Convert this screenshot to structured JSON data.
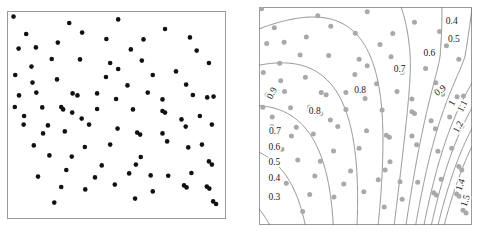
{
  "figure": {
    "type": "two-panel-scientific-figure",
    "panels": [
      "point-pattern-scatter",
      "contour-plot-with-points"
    ],
    "ghost_text": "",
    "colors": {
      "point_black": "#111111",
      "point_gray": "#a9a9a9",
      "contour_line": "#6f6f6f",
      "frame": "#9a9a9a",
      "background": "#ffffff",
      "label_text": "#1a1a1a"
    }
  },
  "chart_data": [
    {
      "type": "scatter",
      "name": "left-panel-point-pattern",
      "title": "",
      "xlabel": "",
      "ylabel": "",
      "xlim": [
        0,
        1
      ],
      "ylim": [
        0,
        1
      ],
      "grid": false,
      "legend": "none",
      "marker": {
        "shape": "circle",
        "color": "#111111",
        "size": 4.6
      },
      "n_points": 96,
      "points": [
        [
          0.012,
          0.992
        ],
        [
          0.508,
          0.978
        ],
        [
          0.73,
          0.93
        ],
        [
          0.337,
          0.912
        ],
        [
          0.848,
          0.888
        ],
        [
          0.628,
          0.878
        ],
        [
          0.222,
          0.862
        ],
        [
          0.118,
          0.838
        ],
        [
          0.036,
          0.832
        ],
        [
          0.88,
          0.822
        ],
        [
          0.193,
          0.78
        ],
        [
          0.327,
          0.778
        ],
        [
          0.62,
          0.772
        ],
        [
          0.47,
          0.76
        ],
        [
          0.938,
          0.76
        ],
        [
          0.097,
          0.742
        ],
        [
          0.508,
          0.73
        ],
        [
          0.02,
          0.7
        ],
        [
          0.218,
          0.678
        ],
        [
          0.552,
          0.648
        ],
        [
          0.83,
          0.652
        ],
        [
          0.12,
          0.612
        ],
        [
          0.292,
          0.608
        ],
        [
          0.408,
          0.608
        ],
        [
          0.038,
          0.598
        ],
        [
          0.315,
          0.598
        ],
        [
          0.96,
          0.592
        ],
        [
          0.93,
          0.588
        ],
        [
          0.718,
          0.578
        ],
        [
          0.148,
          0.538
        ],
        [
          0.238,
          0.54
        ],
        [
          0.247,
          0.528
        ],
        [
          0.408,
          0.53
        ],
        [
          0.578,
          0.528
        ],
        [
          0.718,
          0.52
        ],
        [
          0.29,
          0.512
        ],
        [
          0.73,
          0.512
        ],
        [
          0.335,
          0.482
        ],
        [
          0.06,
          0.452
        ],
        [
          0.175,
          0.448
        ],
        [
          0.952,
          0.452
        ],
        [
          0.828,
          0.442
        ],
        [
          0.505,
          0.432
        ],
        [
          0.255,
          0.418
        ],
        [
          0.598,
          0.412
        ],
        [
          0.612,
          0.402
        ],
        [
          0.718,
          0.408
        ],
        [
          0.152,
          0.408
        ],
        [
          0.74,
          0.368
        ],
        [
          0.35,
          0.34
        ],
        [
          0.84,
          0.338
        ],
        [
          0.182,
          0.298
        ],
        [
          0.288,
          0.292
        ],
        [
          0.615,
          0.29
        ],
        [
          0.592,
          0.252
        ],
        [
          0.43,
          0.248
        ],
        [
          0.938,
          0.268
        ],
        [
          0.952,
          0.252
        ],
        [
          0.128,
          0.192
        ],
        [
          0.56,
          0.208
        ],
        [
          0.662,
          0.198
        ],
        [
          0.398,
          0.188
        ],
        [
          0.745,
          0.196
        ],
        [
          0.855,
          0.21
        ],
        [
          0.492,
          0.152
        ],
        [
          0.238,
          0.14
        ],
        [
          0.82,
          0.148
        ],
        [
          0.832,
          0.138
        ],
        [
          0.928,
          0.142
        ],
        [
          0.94,
          0.132
        ],
        [
          0.672,
          0.118
        ],
        [
          0.205,
          0.062
        ],
        [
          0.062,
          0.495
        ],
        [
          0.895,
          0.495
        ],
        [
          0.672,
          0.7
        ],
        [
          0.45,
          0.69
        ],
        [
          0.782,
          0.718
        ],
        [
          0.37,
          0.452
        ],
        [
          0.108,
          0.348
        ],
        [
          0.47,
          0.352
        ],
        [
          0.905,
          0.352
        ],
        [
          0.262,
          0.225
        ],
        [
          0.352,
          0.128
        ],
        [
          0.588,
          0.082
        ],
        [
          0.958,
          0.068
        ],
        [
          0.972,
          0.055
        ],
        [
          0.102,
          0.662
        ],
        [
          0.862,
          0.6
        ],
        [
          0.452,
          0.88
        ],
        [
          0.568,
          0.828
        ],
        [
          0.276,
          0.96
        ],
        [
          0.072,
          0.905
        ],
        [
          0.648,
          0.612
        ],
        [
          0.498,
          0.58
        ],
        [
          0.808,
          0.478
        ],
        [
          0.018,
          0.54
        ]
      ]
    },
    {
      "type": "contour",
      "name": "right-panel-intensity-contours",
      "title": "",
      "xlabel": "",
      "ylabel": "",
      "xlim": [
        0,
        1
      ],
      "ylim": [
        0,
        1
      ],
      "grid": false,
      "legend": "none",
      "overlay_marker": {
        "shape": "circle",
        "color": "#a9a9a9",
        "size": 5.0
      },
      "contour_levels": [
        0.3,
        0.4,
        0.5,
        0.6,
        0.7,
        0.8,
        0.9,
        1.0,
        1.1,
        1.2,
        1.3,
        1.4,
        1.5
      ],
      "surface_description": "saddle-shaped intensity surface; low values at lower-left (0.3) rising to the right and a high ridge (1.5) at the lower-right corner",
      "labels": [
        {
          "text": "0.4",
          "x": 0.905,
          "y": 0.935,
          "rotation": 0
        },
        {
          "text": "0.5",
          "x": 0.915,
          "y": 0.855,
          "rotation": 0
        },
        {
          "text": "0.6",
          "x": 0.8,
          "y": 0.79,
          "rotation": 0
        },
        {
          "text": "0.7",
          "x": 0.66,
          "y": 0.715,
          "rotation": 0
        },
        {
          "text": "0.8",
          "x": 0.475,
          "y": 0.618,
          "rotation": 0
        },
        {
          "text": "0.9",
          "x": 0.85,
          "y": 0.618,
          "rotation": -38
        },
        {
          "text": "1",
          "x": 0.905,
          "y": 0.56,
          "rotation": -60
        },
        {
          "text": "1.1",
          "x": 0.955,
          "y": 0.545,
          "rotation": -62
        },
        {
          "text": "1.2",
          "x": 0.935,
          "y": 0.45,
          "rotation": -62
        },
        {
          "text": "0.9",
          "x": 0.06,
          "y": 0.605,
          "rotation": -62
        },
        {
          "text": "0.8",
          "x": 0.262,
          "y": 0.525,
          "rotation": 0
        },
        {
          "text": "0.7",
          "x": 0.075,
          "y": 0.432,
          "rotation": 0
        },
        {
          "text": "0.6",
          "x": 0.072,
          "y": 0.36,
          "rotation": 0
        },
        {
          "text": "0.5",
          "x": 0.072,
          "y": 0.288,
          "rotation": 0
        },
        {
          "text": "0.4",
          "x": 0.072,
          "y": 0.215,
          "rotation": 0
        },
        {
          "text": "0.3",
          "x": 0.072,
          "y": 0.128,
          "rotation": 0
        },
        {
          "text": "1.4",
          "x": 0.945,
          "y": 0.185,
          "rotation": -72
        },
        {
          "text": "1.5",
          "x": 0.968,
          "y": 0.112,
          "rotation": -72
        }
      ],
      "points": [
        [
          0.012,
          0.992
        ],
        [
          0.508,
          0.978
        ],
        [
          0.73,
          0.93
        ],
        [
          0.337,
          0.912
        ],
        [
          0.848,
          0.888
        ],
        [
          0.628,
          0.878
        ],
        [
          0.222,
          0.862
        ],
        [
          0.118,
          0.838
        ],
        [
          0.036,
          0.832
        ],
        [
          0.88,
          0.822
        ],
        [
          0.193,
          0.78
        ],
        [
          0.327,
          0.778
        ],
        [
          0.62,
          0.772
        ],
        [
          0.47,
          0.76
        ],
        [
          0.938,
          0.76
        ],
        [
          0.097,
          0.742
        ],
        [
          0.508,
          0.73
        ],
        [
          0.02,
          0.7
        ],
        [
          0.218,
          0.678
        ],
        [
          0.552,
          0.648
        ],
        [
          0.83,
          0.652
        ],
        [
          0.12,
          0.612
        ],
        [
          0.292,
          0.608
        ],
        [
          0.408,
          0.608
        ],
        [
          0.038,
          0.598
        ],
        [
          0.315,
          0.598
        ],
        [
          0.96,
          0.592
        ],
        [
          0.93,
          0.588
        ],
        [
          0.718,
          0.578
        ],
        [
          0.148,
          0.538
        ],
        [
          0.238,
          0.54
        ],
        [
          0.247,
          0.528
        ],
        [
          0.408,
          0.53
        ],
        [
          0.578,
          0.528
        ],
        [
          0.718,
          0.52
        ],
        [
          0.29,
          0.512
        ],
        [
          0.73,
          0.512
        ],
        [
          0.335,
          0.482
        ],
        [
          0.06,
          0.452
        ],
        [
          0.175,
          0.448
        ],
        [
          0.952,
          0.452
        ],
        [
          0.828,
          0.442
        ],
        [
          0.505,
          0.432
        ],
        [
          0.255,
          0.418
        ],
        [
          0.598,
          0.412
        ],
        [
          0.612,
          0.402
        ],
        [
          0.718,
          0.408
        ],
        [
          0.152,
          0.408
        ],
        [
          0.74,
          0.368
        ],
        [
          0.35,
          0.34
        ],
        [
          0.84,
          0.338
        ],
        [
          0.182,
          0.298
        ],
        [
          0.288,
          0.292
        ],
        [
          0.615,
          0.29
        ],
        [
          0.592,
          0.252
        ],
        [
          0.43,
          0.248
        ],
        [
          0.938,
          0.268
        ],
        [
          0.952,
          0.252
        ],
        [
          0.128,
          0.192
        ],
        [
          0.56,
          0.208
        ],
        [
          0.662,
          0.198
        ],
        [
          0.398,
          0.188
        ],
        [
          0.745,
          0.196
        ],
        [
          0.855,
          0.21
        ],
        [
          0.492,
          0.152
        ],
        [
          0.238,
          0.14
        ],
        [
          0.82,
          0.148
        ],
        [
          0.832,
          0.138
        ],
        [
          0.928,
          0.142
        ],
        [
          0.94,
          0.132
        ],
        [
          0.672,
          0.118
        ],
        [
          0.205,
          0.062
        ],
        [
          0.062,
          0.495
        ],
        [
          0.895,
          0.495
        ],
        [
          0.672,
          0.7
        ],
        [
          0.45,
          0.69
        ],
        [
          0.782,
          0.718
        ],
        [
          0.37,
          0.452
        ],
        [
          0.108,
          0.348
        ],
        [
          0.47,
          0.352
        ],
        [
          0.905,
          0.352
        ],
        [
          0.262,
          0.225
        ],
        [
          0.352,
          0.128
        ],
        [
          0.588,
          0.082
        ],
        [
          0.958,
          0.068
        ],
        [
          0.972,
          0.055
        ],
        [
          0.102,
          0.662
        ],
        [
          0.862,
          0.6
        ],
        [
          0.452,
          0.88
        ],
        [
          0.568,
          0.828
        ],
        [
          0.276,
          0.96
        ],
        [
          0.072,
          0.905
        ],
        [
          0.648,
          0.612
        ],
        [
          0.498,
          0.58
        ],
        [
          0.808,
          0.478
        ],
        [
          0.018,
          0.54
        ]
      ]
    }
  ]
}
